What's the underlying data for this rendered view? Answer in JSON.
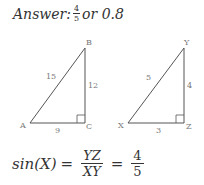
{
  "answer": {
    "prefix": "Answer:",
    "fraction": {
      "numerator": "4",
      "denominator": "5"
    },
    "suffix": "or 0.8"
  },
  "triangles": [
    {
      "name": "ABC",
      "vertices": {
        "A": "A",
        "B": "B",
        "C": "C"
      },
      "sides": {
        "hypotenuse": "15",
        "vertical": "12",
        "horizontal": "9"
      },
      "right_angle_at": "C"
    },
    {
      "name": "XYZ",
      "vertices": {
        "X": "X",
        "Y": "Y",
        "Z": "Z"
      },
      "sides": {
        "hypotenuse": "5",
        "vertical": "4",
        "horizontal": "3"
      },
      "right_angle_at": "Z"
    }
  ],
  "formula": {
    "lhs": "sin(X)",
    "equals": "=",
    "fraction1": {
      "numerator": "YZ",
      "denominator": "XY"
    },
    "equals2": "=",
    "fraction2": {
      "numerator": "4",
      "denominator": "5"
    }
  },
  "colors": {
    "line": "#555555",
    "text": "#333333",
    "label": "#777777"
  }
}
